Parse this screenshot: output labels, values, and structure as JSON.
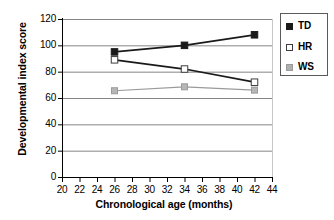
{
  "chart_data": {
    "type": "line",
    "title": "",
    "xlabel": "Chronological age (months)",
    "ylabel": "Developmental index score",
    "x": [
      26,
      34,
      42
    ],
    "xlim": [
      20,
      44
    ],
    "ylim": [
      0,
      120
    ],
    "xticks": [
      20,
      22,
      24,
      26,
      28,
      30,
      32,
      34,
      36,
      38,
      40,
      42,
      44
    ],
    "yticks": [
      0,
      20,
      40,
      60,
      80,
      100,
      120
    ],
    "grid": "horizontal",
    "legend_position": "right",
    "series": [
      {
        "name": "TD",
        "values": [
          95,
          100,
          108
        ],
        "color": "#1a1a1a",
        "marker": "filled-square"
      },
      {
        "name": "HR",
        "values": [
          89,
          82,
          72
        ],
        "color": "#1a1a1a",
        "marker": "open-square"
      },
      {
        "name": "WS",
        "values": [
          65.5,
          68.5,
          66
        ],
        "color": "#9a9a9a",
        "marker": "gray-square"
      }
    ]
  },
  "legend": {
    "items": [
      {
        "label": "TD",
        "swatch": "filled-square-swatch"
      },
      {
        "label": "HR",
        "swatch": "open-square-swatch"
      },
      {
        "label": "WS",
        "swatch": "gray-square-swatch"
      }
    ]
  },
  "axes": {
    "y_title": "Developmental index score",
    "x_title": "Chronological age (months)",
    "y_labels": [
      "120",
      "100",
      "80",
      "60",
      "40",
      "20",
      "0"
    ],
    "x_labels": [
      "20",
      "22",
      "24",
      "26",
      "28",
      "30",
      "32",
      "34",
      "36",
      "38",
      "40",
      "42",
      "44"
    ]
  },
  "colors": {
    "axis": "#000000",
    "gridline": "#858585",
    "td": "#1a1a1a",
    "hr": "#1a1a1a",
    "ws": "#9a9a9a",
    "background": "#ffffff"
  }
}
